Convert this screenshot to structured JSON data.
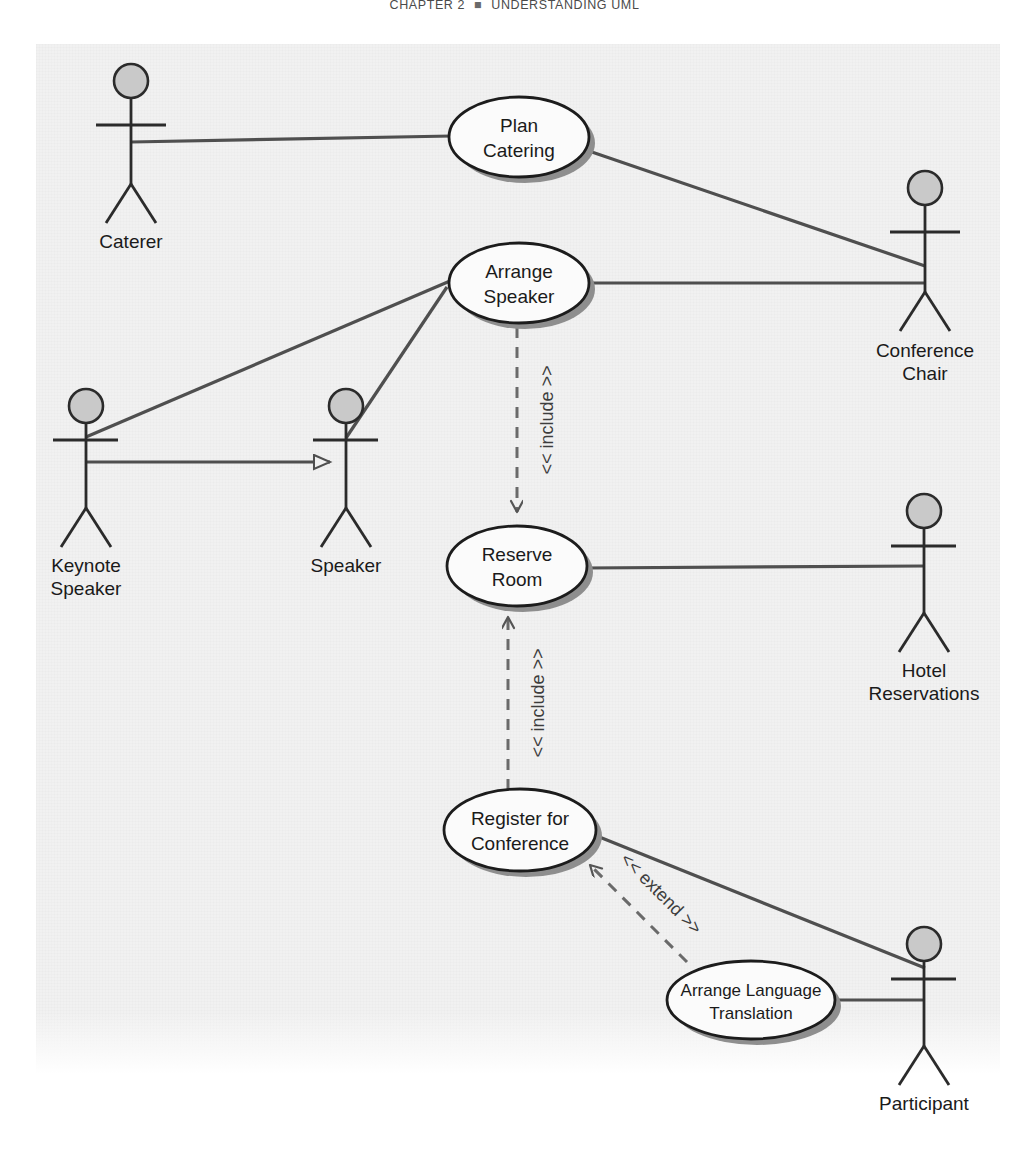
{
  "page": {
    "running_head": "CHAPTER 2",
    "running_head_separator": "■",
    "running_head_title": "UNDERSTANDING UML"
  },
  "diagram": {
    "type": "uml-use-case-diagram",
    "background_color": "#f1f1f1",
    "line_color": "#4f4f4f",
    "shadow_color": "#888888",
    "actor_head_fill": "#c9c9c9",
    "use_case_fill": "#fbfbfb",
    "actors": [
      {
        "id": "caterer",
        "label_line1": "Caterer",
        "label_line2": ""
      },
      {
        "id": "conference-chair",
        "label_line1": "Conference",
        "label_line2": "Chair"
      },
      {
        "id": "keynote-speaker",
        "label_line1": "Keynote",
        "label_line2": "Speaker"
      },
      {
        "id": "speaker",
        "label_line1": "Speaker",
        "label_line2": ""
      },
      {
        "id": "hotel-reservations",
        "label_line1": "Hotel",
        "label_line2": "Reservations"
      },
      {
        "id": "participant",
        "label_line1": "Participant",
        "label_line2": ""
      }
    ],
    "use_cases": [
      {
        "id": "plan-catering",
        "line1": "Plan",
        "line2": "Catering"
      },
      {
        "id": "arrange-speaker",
        "line1": "Arrange",
        "line2": "Speaker"
      },
      {
        "id": "reserve-room",
        "line1": "Reserve",
        "line2": "Room"
      },
      {
        "id": "register-for-conference",
        "line1": "Register for",
        "line2": "Conference"
      },
      {
        "id": "arrange-language-translation",
        "line1": "Arrange Language",
        "line2": "Translation"
      }
    ],
    "relationships": [
      {
        "id": "include-arrange-speaker-reserve-room",
        "stereotype": "<< include >>",
        "kind": "include",
        "from": "arrange-speaker",
        "to": "reserve-room"
      },
      {
        "id": "include-register-reserve-room",
        "stereotype": "<< include >>",
        "kind": "include",
        "from": "register-for-conference",
        "to": "reserve-room"
      },
      {
        "id": "extend-translation-register",
        "stereotype": "<< extend >>",
        "kind": "extend",
        "from": "arrange-language-translation",
        "to": "register-for-conference"
      },
      {
        "id": "generalization-keynote-speaker",
        "stereotype": "",
        "kind": "generalization",
        "from": "keynote-speaker",
        "to": "speaker"
      }
    ],
    "associations": [
      {
        "id": "assoc-caterer-plan-catering",
        "from": "caterer",
        "to": "plan-catering"
      },
      {
        "id": "assoc-chair-plan-catering",
        "from": "conference-chair",
        "to": "plan-catering"
      },
      {
        "id": "assoc-chair-arrange-speaker",
        "from": "conference-chair",
        "to": "arrange-speaker"
      },
      {
        "id": "assoc-keynote-arrange-speaker",
        "from": "keynote-speaker",
        "to": "arrange-speaker"
      },
      {
        "id": "assoc-speaker-arrange-speaker",
        "from": "speaker",
        "to": "arrange-speaker"
      },
      {
        "id": "assoc-hotel-reserve-room",
        "from": "hotel-reservations",
        "to": "reserve-room"
      },
      {
        "id": "assoc-participant-register",
        "from": "participant",
        "to": "register-for-conference"
      },
      {
        "id": "assoc-participant-translation",
        "from": "participant",
        "to": "arrange-language-translation"
      }
    ]
  }
}
